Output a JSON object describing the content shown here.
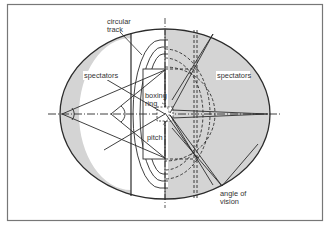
{
  "diagram": {
    "type": "stadium-plan",
    "labels": {
      "circular_track_line1": "circular",
      "circular_track_line2": "track",
      "spectators_left": "spectators",
      "spectators_right": "spectators",
      "boxing_ring_line1": "boxing",
      "boxing_ring_line2": "ring",
      "pitch": "pitch",
      "angle_of_vision_line1": "angle of",
      "angle_of_vision_line2": "vision"
    },
    "colors": {
      "frame": "#777777",
      "spectator_fill": "#d4d4d4",
      "line": "#2b2b2b",
      "background": "#ffffff"
    }
  }
}
